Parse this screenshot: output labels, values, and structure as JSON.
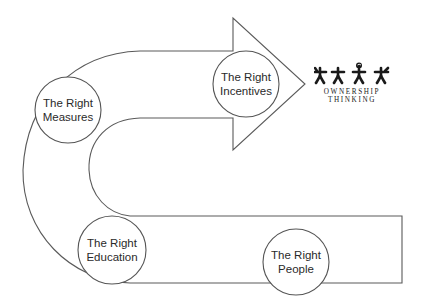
{
  "diagram": {
    "type": "process-arrow",
    "stages": [
      {
        "id": "measures",
        "line1": "The Right",
        "line2": "Measures"
      },
      {
        "id": "incentives",
        "line1": "The Right",
        "line2": "Incentives"
      },
      {
        "id": "education",
        "line1": "The Right",
        "line2": "Education"
      },
      {
        "id": "people",
        "line1": "The Right",
        "line2": "People"
      }
    ],
    "flow_order": [
      "people",
      "education",
      "measures",
      "incentives"
    ],
    "arrow_target": "ownership-thinking-logo"
  },
  "logo": {
    "line1": "OWNERSHIP",
    "line2": "THINKING",
    "figure_count": 4
  },
  "colors": {
    "stroke": "#5a5a5a",
    "text": "#2a2a2a",
    "background": "#ffffff",
    "logo": "#1a1a1a"
  }
}
